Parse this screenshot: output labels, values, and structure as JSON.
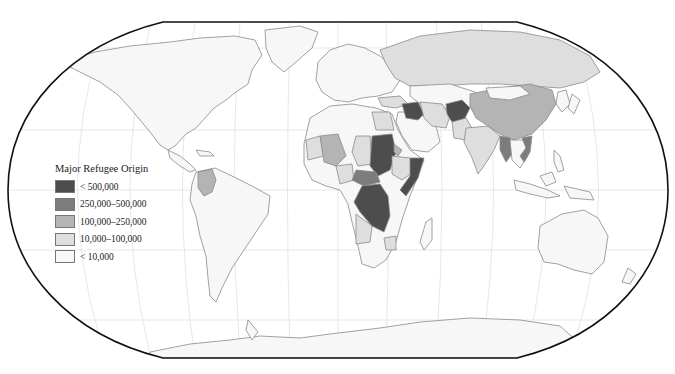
{
  "map": {
    "title": "Major Refugee Origin",
    "projection": "Robinson-like world map",
    "colors": {
      "ocean": "#ffffff",
      "land_default": "#f7f7f7",
      "border": "#8a8a8a",
      "graticule": "#d4d4d4",
      "frame": "#111111"
    },
    "highlighted_countries": [
      {
        "name": "Afghanistan",
        "class": 0
      },
      {
        "name": "Iraq",
        "class": 0
      },
      {
        "name": "Sudan",
        "class": 0
      },
      {
        "name": "Somalia",
        "class": 0
      },
      {
        "name": "Democratic Republic of the Congo",
        "class": 0
      },
      {
        "name": "Palestine",
        "class": 0
      },
      {
        "name": "Central African Republic",
        "class": 1
      },
      {
        "name": "Myanmar",
        "class": 1
      },
      {
        "name": "Vietnam",
        "class": 1
      },
      {
        "name": "China",
        "class": 2
      },
      {
        "name": "Colombia",
        "class": 2
      },
      {
        "name": "Mali",
        "class": 2
      },
      {
        "name": "Eritrea",
        "class": 2
      },
      {
        "name": "Pakistan",
        "class": 3
      },
      {
        "name": "Iran",
        "class": 3
      },
      {
        "name": "Russia",
        "class": 3
      },
      {
        "name": "Ethiopia",
        "class": 3
      },
      {
        "name": "Angola",
        "class": 3
      },
      {
        "name": "Zimbabwe",
        "class": 3
      },
      {
        "name": "Egypt",
        "class": 3
      },
      {
        "name": "Chad",
        "class": 3
      },
      {
        "name": "Nigeria",
        "class": 3
      },
      {
        "name": "Mauritania",
        "class": 3
      },
      {
        "name": "India",
        "class": 3
      },
      {
        "name": "Turkey",
        "class": 3
      }
    ]
  },
  "legend": {
    "title": "Major Refugee Origin",
    "items": [
      {
        "label": "< 500,000",
        "color": "#4d4d4d"
      },
      {
        "label": "250,000–500,000",
        "color": "#7c7c7c"
      },
      {
        "label": "100,000–250,000",
        "color": "#b4b4b4"
      },
      {
        "label": "10,000–100,000",
        "color": "#dedede"
      },
      {
        "label": "< 10,000",
        "color": "#f7f7f7"
      }
    ]
  },
  "caption": {
    "text": ""
  }
}
